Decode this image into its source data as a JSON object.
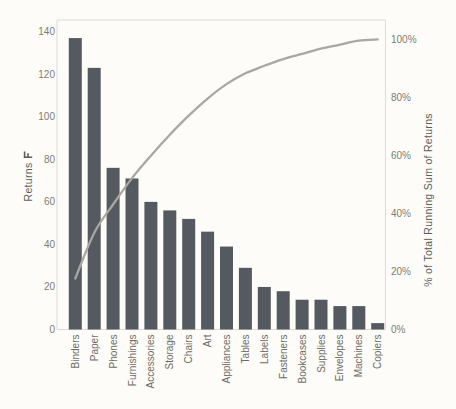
{
  "chart_data": {
    "type": "bar+line (pareto)",
    "title": "",
    "categories": [
      "Binders",
      "Paper",
      "Phones",
      "Furnishings",
      "Accessories",
      "Storage",
      "Chairs",
      "Art",
      "Appliances",
      "Tables",
      "Labels",
      "Fasteners",
      "Bookcases",
      "Supplies",
      "Envelopes",
      "Machines",
      "Copiers"
    ],
    "series": [
      {
        "name": "Returns",
        "type": "bar",
        "axis": "left",
        "values": [
          137,
          123,
          76,
          71,
          60,
          56,
          52,
          46,
          39,
          29,
          20,
          18,
          14,
          14,
          11,
          11,
          3
        ]
      },
      {
        "name": "Running % of Total Returns",
        "type": "line",
        "axis": "right",
        "values": [
          17.6,
          33.3,
          43.1,
          52.2,
          59.9,
          67.1,
          73.7,
          79.6,
          84.6,
          88.3,
          90.9,
          93.2,
          95.0,
          96.8,
          98.2,
          99.6,
          100.0
        ]
      }
    ],
    "left_axis": {
      "label": "Returns",
      "has_sort_icon": true,
      "ticks": [
        0,
        20,
        40,
        60,
        80,
        100,
        120,
        140
      ],
      "range": [
        0,
        140
      ]
    },
    "right_axis": {
      "label": "% of Total Running Sum of Returns",
      "ticks": [
        "0%",
        "20%",
        "40%",
        "60%",
        "80%",
        "100%"
      ],
      "tick_values": [
        0,
        20,
        40,
        60,
        80,
        100
      ],
      "range": [
        0,
        100
      ]
    },
    "grid": false,
    "legend": "none",
    "colors": {
      "bar": "#555a60",
      "line": "#a8a7a3",
      "tick_text": "#7d7c76",
      "category_text": "#6d6c66",
      "axis_title_text": "#5d5c56",
      "pane_border": "#dddbd4",
      "background": "#fdfcf8"
    }
  }
}
